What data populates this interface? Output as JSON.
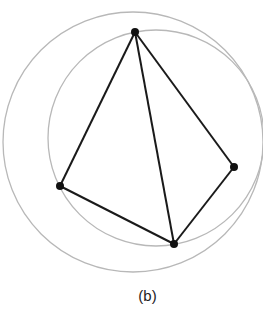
{
  "figure": {
    "caption": "(b)",
    "colors": {
      "edge": "#1a1a1a",
      "circle": "#b8b8b8",
      "vertex": "#111111"
    },
    "vertices": [
      {
        "id": "top",
        "x": 135,
        "y": 32
      },
      {
        "id": "left",
        "x": 60,
        "y": 186
      },
      {
        "id": "right",
        "x": 234,
        "y": 167
      },
      {
        "id": "bottom",
        "x": 174,
        "y": 244
      }
    ],
    "edges": [
      [
        "top",
        "left"
      ],
      [
        "top",
        "bottom"
      ],
      [
        "top",
        "right"
      ],
      [
        "left",
        "bottom"
      ],
      [
        "right",
        "bottom"
      ]
    ],
    "circles": [
      {
        "cx": 156,
        "cy": 138,
        "r": 108
      },
      {
        "cx": 133,
        "cy": 142,
        "r": 130
      }
    ]
  }
}
